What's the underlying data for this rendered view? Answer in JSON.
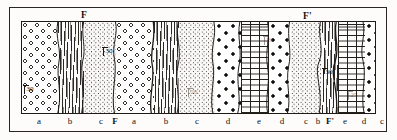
{
  "figure": {
    "kind": "geologic-cross-section-strip",
    "frame": {
      "x": 9,
      "y": 7,
      "width": 378,
      "height": 125
    },
    "panel": {
      "x": 21,
      "y": 21,
      "width": 355,
      "height": 93
    }
  },
  "fault_labels": [
    {
      "name": "fault-label-f",
      "text": "F",
      "x": 81,
      "y": 10
    },
    {
      "name": "fault-label-f-prime",
      "text": "F'",
      "x": 303,
      "y": 11
    }
  ],
  "units": [
    {
      "id": "a1",
      "label": "a",
      "pattern": "open-circles",
      "rock": "conglomerate",
      "x": 21,
      "width": 36,
      "label_x": 39
    },
    {
      "id": "b1",
      "label": "b",
      "pattern": "wavy-vertical",
      "rock": "schist",
      "x": 57,
      "width": 26,
      "label_x": 70
    },
    {
      "id": "c1",
      "label": "c",
      "pattern": "fine-stipple",
      "rock": "sandstone",
      "x": 83,
      "width": 32,
      "label_x": 98
    },
    {
      "id": "a2",
      "label": "a",
      "pattern": "open-circles",
      "rock": "conglomerate",
      "x": 115,
      "width": 38,
      "label_x": 131
    },
    {
      "id": "b2",
      "label": "b",
      "pattern": "wavy-vertical",
      "rock": "schist",
      "x": 153,
      "width": 25,
      "label_x": 163
    },
    {
      "id": "c2",
      "label": "c",
      "pattern": "fine-stipple",
      "rock": "sandstone",
      "x": 178,
      "width": 36,
      "label_x": 194
    },
    {
      "id": "d1",
      "label": "d",
      "pattern": "bold-dots",
      "rock": "conglomerate",
      "x": 214,
      "width": 26,
      "label_x": 227
    },
    {
      "id": "e1",
      "label": "e",
      "pattern": "brick",
      "rock": "limestone",
      "x": 240,
      "width": 28,
      "label_x": 254
    },
    {
      "id": "d2",
      "label": "d",
      "pattern": "bold-dots",
      "rock": "conglomerate",
      "x": 268,
      "width": 22,
      "label_x": 279
    },
    {
      "id": "c3",
      "label": "c",
      "pattern": "fine-stipple",
      "rock": "sandstone",
      "x": 290,
      "width": 31,
      "label_x": 304
    },
    {
      "id": "b3",
      "label": "b",
      "pattern": "wavy-vertical",
      "rock": "schist",
      "x": 321,
      "width": 16,
      "label_x": 327
    },
    {
      "id": "e2",
      "label": "e",
      "pattern": "brick",
      "rock": "limestone",
      "x": 337,
      "width": 27,
      "label_x": 350
    },
    {
      "id": "d3",
      "label": "d",
      "pattern": "bold-dots",
      "rock": "conglomerate",
      "x": 364,
      "width": 22,
      "label_x": 373
    },
    {
      "id": "c4",
      "label": "c",
      "pattern": "fine-stipple",
      "rock": "sandstone",
      "x": 386,
      "width": 12,
      "label_x": 390
    }
  ],
  "bottom_labels": [
    {
      "text": "a",
      "x": 39,
      "bold": false
    },
    {
      "text": "b",
      "x": 70,
      "bold": false
    },
    {
      "text": "c",
      "x": 101,
      "bold": false
    },
    {
      "text": "F",
      "x": 115,
      "bold": true
    },
    {
      "text": "a",
      "x": 134,
      "bold": false
    },
    {
      "text": "b",
      "x": 166,
      "bold": false
    },
    {
      "text": "c",
      "x": 197,
      "bold": false
    },
    {
      "text": "d",
      "x": 228,
      "bold": false
    },
    {
      "text": "e",
      "x": 259,
      "bold": false
    },
    {
      "text": "d",
      "x": 282,
      "bold": false
    },
    {
      "text": "c",
      "x": 306,
      "bold": false
    },
    {
      "text": "b",
      "x": 318,
      "bold": false
    },
    {
      "text": "F'",
      "x": 330,
      "bold": true
    },
    {
      "text": "e",
      "x": 345,
      "bold": false
    },
    {
      "text": "d",
      "x": 364,
      "bold": false
    },
    {
      "text": "c",
      "x": 382,
      "bold": false
    }
  ],
  "dip_measurements": [
    {
      "value": "30",
      "x": 24,
      "y": 85,
      "faint": false
    },
    {
      "value": "30",
      "x": 103,
      "y": 47,
      "faint": false
    },
    {
      "value": "20",
      "x": 188,
      "y": 88,
      "faint": true
    },
    {
      "value": "20",
      "x": 264,
      "y": 36,
      "faint": true
    },
    {
      "value": "30",
      "x": 323,
      "y": 68,
      "faint": false
    },
    {
      "value": "25",
      "x": 348,
      "y": 91,
      "faint": true
    }
  ],
  "faults": [
    {
      "name": "fault-f",
      "top_x": 116,
      "bottom_x": 113
    },
    {
      "name": "fault-f-prime",
      "top_x": 321,
      "bottom_x": 324
    }
  ]
}
